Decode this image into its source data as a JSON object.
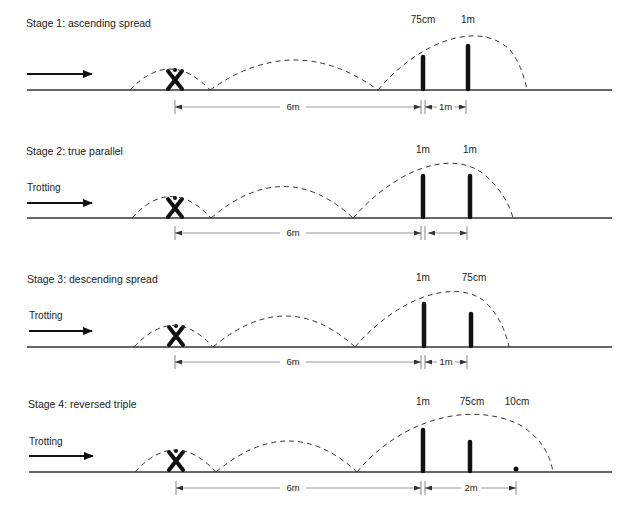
{
  "stages": [
    {
      "title": "Stage 1: ascending spread",
      "approach_label": "",
      "pole_labels": [
        "75cm",
        "1m"
      ],
      "distances": [
        "6m",
        "1m"
      ]
    },
    {
      "title": "Stage 2: true parallel",
      "approach_label": "Trotting",
      "pole_labels": [
        "1m",
        "1m"
      ],
      "distances": [
        "6m",
        ""
      ]
    },
    {
      "title": "Stage 3: descending spread",
      "approach_label": "Trotting",
      "pole_labels": [
        "1m",
        "75cm"
      ],
      "distances": [
        "6m",
        "1m"
      ]
    },
    {
      "title": "Stage 4: reversed triple",
      "approach_label": "Trotting",
      "pole_labels": [
        "1m",
        "75cm",
        "10cm"
      ],
      "distances": [
        "6m",
        "2m"
      ]
    }
  ],
  "icons": {
    "direction": "arrow-right-icon",
    "takeoff_marker": "cross-marker-icon"
  }
}
